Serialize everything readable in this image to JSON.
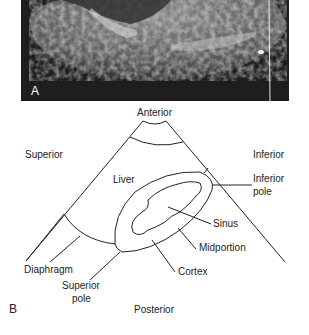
{
  "figure": {
    "panel_a": {
      "letter": "A",
      "description": "Ultrasound image of the right kidney (longitudinal view)"
    },
    "panel_b": {
      "letter": "B",
      "labels": {
        "anterior": "Anterior",
        "posterior": "Posterior",
        "superior": "Superior",
        "inferior": "Inferior",
        "liver": "Liver",
        "inferior_pole_1": "Inferior",
        "inferior_pole_2": "pole",
        "sinus": "Sinus",
        "midportion": "Midportion",
        "cortex": "Cortex",
        "diaphragm": "Diaphragm",
        "superior_pole_1": "Superior",
        "superior_pole_2": "pole"
      }
    }
  },
  "colors": {
    "ultrasound_bg": "#1e1e1e",
    "line": "#222222"
  }
}
